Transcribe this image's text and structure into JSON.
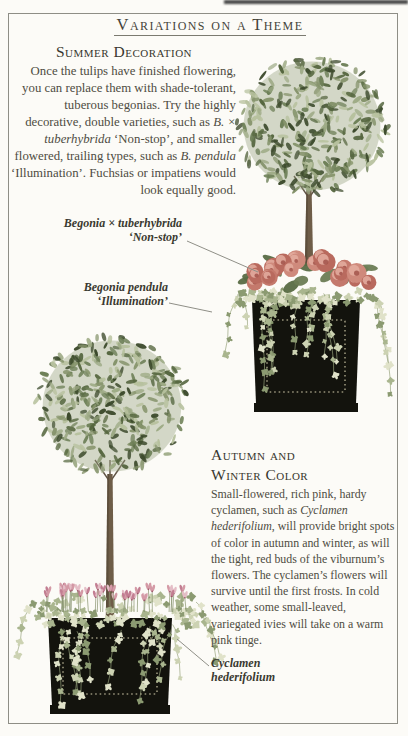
{
  "page": {
    "title": "Variations on a Theme"
  },
  "summer": {
    "heading": "Summer Decoration",
    "body_runs": [
      {
        "text": "Once the tulips have finished flowering, you can replace them with shade-tolerant, tuberous begonias. Try the highly decorative, double varieties, such as ",
        "italic": false
      },
      {
        "text": "B. × tuberhybrida",
        "italic": true
      },
      {
        "text": " ‘Non-stop’, and smaller flowered, trailing types, such as ",
        "italic": false
      },
      {
        "text": "B. pendula",
        "italic": true
      },
      {
        "text": " ‘Illumination’. Fuchsias or impatiens would look equally good.",
        "italic": false
      }
    ]
  },
  "autumn": {
    "heading_line1": "Autumn and",
    "heading_line2": "Winter Color",
    "body_runs": [
      {
        "text": "Small-flowered, rich pink, hardy cyclamen, such as ",
        "italic": false
      },
      {
        "text": "Cyclamen hederifolium",
        "italic": true
      },
      {
        "text": ", will provide bright spots of color in autumn and winter, as will the tight, red buds of the viburnum’s flowers. The cyclamen’s flowers will survive until the first frosts. In cold weather, some small-leaved, variegated ivies will take on a warm pink tinge.",
        "italic": false
      }
    ]
  },
  "labels": {
    "begonia_tuberhybrida": {
      "line1": "Begonia × tuberhybrida",
      "line2": "‘Non-stop’"
    },
    "begonia_pendula": {
      "line1": "Begonia pendula",
      "line2": "‘Illumination’"
    },
    "cyclamen": {
      "line1": "Cyclamen",
      "line2": "hederifolium"
    }
  },
  "colors": {
    "frame": "#8e8e86",
    "leader_line": "#8f8f87",
    "planter_black": "#13130d",
    "planter_stitch": "#d6cfae",
    "foliage_blob": "#97a37f",
    "foliage_leaves": [
      "#85936b",
      "#6d7f57",
      "#9daa85",
      "#55663f",
      "#b7c19e",
      "#3c4a2c"
    ],
    "trunk": "#6e5d48",
    "trunk_dark": "#4f4232",
    "begonia_petals": [
      "#c4796c",
      "#cf8a7c",
      "#b96a5e"
    ],
    "begonia_light": "#e2ab9d",
    "begonia_core": "#a2544a",
    "begonia_leaf": [
      "#6c7c54",
      "#596b44"
    ],
    "ivy_colors": [
      "#a9b58e",
      "#ccd2b2",
      "#8b9a71",
      "#e0e2c9"
    ],
    "ivy_stem": "#95a17b",
    "cyclamen_pinks": [
      "#d49aa6",
      "#c27e92",
      "#e4bdc6"
    ],
    "cyclamen_stem": "#8a9672",
    "cyclamen_eye": "#9c5568"
  }
}
